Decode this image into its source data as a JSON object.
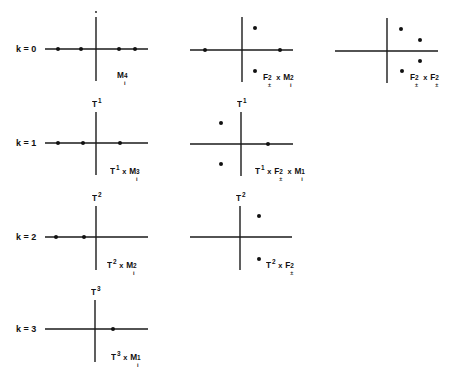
{
  "rows": [
    {
      "k_label": "k = 0",
      "panels": [
        {
          "top_label": "",
          "product": "M_i^4",
          "parts": [
            {
              "base": "M",
              "sup": "4",
              "sub": "i"
            }
          ]
        },
        {
          "top_label": "",
          "product": "F_±^2 x M_i^2",
          "parts": [
            {
              "base": "F",
              "sup": "2",
              "sub": "±"
            },
            {
              "base": "M",
              "sup": "2",
              "sub": "i"
            }
          ]
        },
        {
          "top_label": "",
          "product": "F_±^2 x F_±^2",
          "parts": [
            {
              "base": "F",
              "sup": "2",
              "sub": "±"
            },
            {
              "base": "F",
              "sup": "2",
              "sub": "±"
            }
          ]
        }
      ]
    },
    {
      "k_label": "k = 1",
      "panels": [
        {
          "top_label": "T1",
          "product": "T^1 x M_i^3"
        },
        {
          "top_label": "T1",
          "product": "T^1 x F_±^2 x M_i^1"
        }
      ]
    },
    {
      "k_label": "k = 2",
      "panels": [
        {
          "top_label": "T2",
          "product": "T^2 x M_i^2"
        },
        {
          "top_label": "T2",
          "product": "T^2 x F_±^2"
        }
      ]
    },
    {
      "k_label": "k = 3",
      "panels": [
        {
          "top_label": "T3",
          "product": "T^3 x M_i^1"
        }
      ]
    }
  ],
  "labels": {
    "k0": "k = 0",
    "k1": "k = 1",
    "k2": "k = 2",
    "k3": "k = 3",
    "T": "T",
    "M": "M",
    "F": "F",
    "x": "x",
    "i": "i",
    "pm": "±",
    "n1": "1",
    "n2": "2",
    "n3": "3",
    "n4": "4"
  }
}
